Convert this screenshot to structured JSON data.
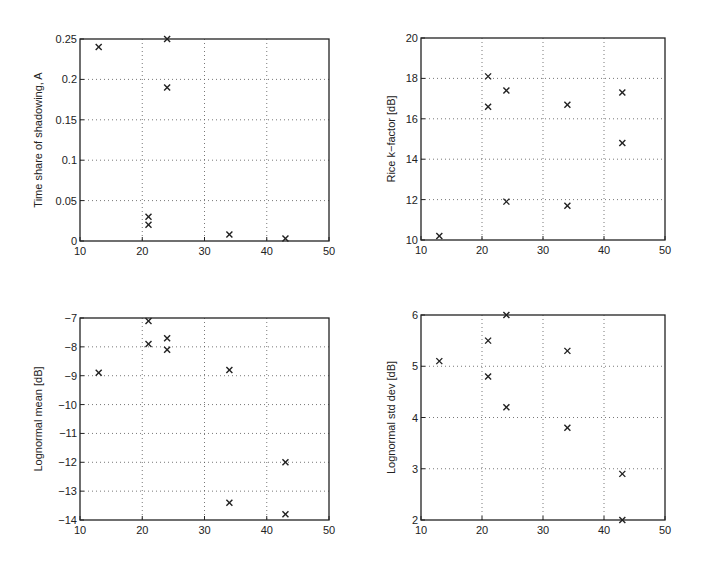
{
  "chart_data": [
    {
      "type": "scatter",
      "id": "time-share-shadowing",
      "title": "",
      "xlabel": "",
      "ylabel": "Time share of shadowing, A",
      "xlim": [
        10,
        50
      ],
      "ylim": [
        0,
        0.25
      ],
      "xticks": [
        10,
        20,
        30,
        40,
        50
      ],
      "yticks": [
        0,
        0.05,
        0.1,
        0.15,
        0.2,
        0.25
      ],
      "ytick_labels": [
        "0",
        "0.05",
        "0.1",
        "0.15",
        "0.2",
        "0.25"
      ],
      "grid": true,
      "marker": "x",
      "frame": {
        "left": 80,
        "top": 39,
        "right": 329,
        "bottom": 241
      },
      "points": [
        {
          "x": 13,
          "y": 0.24
        },
        {
          "x": 21,
          "y": 0.03
        },
        {
          "x": 21,
          "y": 0.02
        },
        {
          "x": 24,
          "y": 0.25
        },
        {
          "x": 24,
          "y": 0.19
        },
        {
          "x": 34,
          "y": 0.008
        },
        {
          "x": 43,
          "y": 0.003
        }
      ]
    },
    {
      "type": "scatter",
      "id": "rice-k-factor",
      "title": "",
      "xlabel": "",
      "ylabel": "Rice k−factor [dB]",
      "xlim": [
        10,
        50
      ],
      "ylim": [
        10,
        20
      ],
      "xticks": [
        10,
        20,
        30,
        40,
        50
      ],
      "yticks": [
        10,
        12,
        14,
        16,
        18,
        20
      ],
      "ytick_labels": [
        "10",
        "12",
        "14",
        "16",
        "18",
        "20"
      ],
      "grid": true,
      "marker": "x",
      "frame": {
        "left": 421,
        "top": 38,
        "right": 665,
        "bottom": 240
      },
      "points": [
        {
          "x": 13,
          "y": 10.2
        },
        {
          "x": 21,
          "y": 18.1
        },
        {
          "x": 21,
          "y": 16.6
        },
        {
          "x": 24,
          "y": 17.4
        },
        {
          "x": 24,
          "y": 11.9
        },
        {
          "x": 34,
          "y": 16.7
        },
        {
          "x": 34,
          "y": 11.7
        },
        {
          "x": 43,
          "y": 17.3
        },
        {
          "x": 43,
          "y": 14.8
        }
      ]
    },
    {
      "type": "scatter",
      "id": "lognormal-mean",
      "title": "",
      "xlabel": "",
      "ylabel": "Lognormal mean [dB]",
      "xlim": [
        10,
        50
      ],
      "ylim": [
        -14,
        -7
      ],
      "xticks": [
        10,
        20,
        30,
        40,
        50
      ],
      "yticks": [
        -14,
        -13,
        -12,
        -11,
        -10,
        -9,
        -8,
        -7
      ],
      "ytick_labels": [
        "−14",
        "−13",
        "−12",
        "−11",
        "−10",
        "−9",
        "−8",
        "−7"
      ],
      "grid": true,
      "marker": "x",
      "frame": {
        "left": 80,
        "top": 318,
        "right": 329,
        "bottom": 520
      },
      "points": [
        {
          "x": 13,
          "y": -8.9
        },
        {
          "x": 21,
          "y": -7.1
        },
        {
          "x": 21,
          "y": -7.9
        },
        {
          "x": 24,
          "y": -7.7
        },
        {
          "x": 24,
          "y": -8.1
        },
        {
          "x": 34,
          "y": -8.8
        },
        {
          "x": 34,
          "y": -13.4
        },
        {
          "x": 43,
          "y": -12.0
        },
        {
          "x": 43,
          "y": -13.8
        }
      ]
    },
    {
      "type": "scatter",
      "id": "lognormal-std-dev",
      "title": "",
      "xlabel": "",
      "ylabel": "Lognormal std dev [dB]",
      "xlim": [
        10,
        50
      ],
      "ylim": [
        2,
        6
      ],
      "xticks": [
        10,
        20,
        30,
        40,
        50
      ],
      "yticks": [
        2,
        3,
        4,
        5,
        6
      ],
      "ytick_labels": [
        "2",
        "3",
        "4",
        "5",
        "6"
      ],
      "grid": true,
      "marker": "x",
      "frame": {
        "left": 421,
        "top": 315,
        "right": 665,
        "bottom": 520
      },
      "points": [
        {
          "x": 13,
          "y": 5.1
        },
        {
          "x": 21,
          "y": 5.5
        },
        {
          "x": 21,
          "y": 4.8
        },
        {
          "x": 24,
          "y": 6.0
        },
        {
          "x": 24,
          "y": 4.2
        },
        {
          "x": 34,
          "y": 5.3
        },
        {
          "x": 34,
          "y": 3.8
        },
        {
          "x": 43,
          "y": 2.9
        },
        {
          "x": 43,
          "y": 2.0
        }
      ]
    }
  ]
}
